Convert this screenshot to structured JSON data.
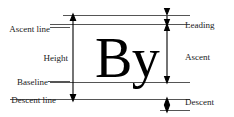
{
  "diagram": {
    "sample_text": "By",
    "colors": {
      "background": "#ffffff",
      "rule": "#555555",
      "arrow": "#000000",
      "text": "#1a1a1a",
      "glyph": "#000000"
    },
    "left_labels": [
      {
        "id": "ascent-line",
        "text": "Ascent line",
        "y": 29
      },
      {
        "id": "height",
        "text": "Height",
        "y": 58
      },
      {
        "id": "baseline",
        "text": "Baseline",
        "y": 82
      },
      {
        "id": "descent-line",
        "text": "Descent line",
        "y": 99
      }
    ],
    "right_labels": [
      {
        "id": "leading",
        "text": "Leading",
        "y": 25
      },
      {
        "id": "ascent",
        "text": "Ascent",
        "y": 57
      },
      {
        "id": "descent",
        "text": "Descent",
        "y": 103
      }
    ],
    "rules": [
      {
        "id": "leading-top-line",
        "y": 15,
        "x1": 63,
        "x2": 190
      },
      {
        "id": "ascent-line-rule",
        "y": 24.5,
        "x1": 50,
        "x2": 190
      },
      {
        "id": "baseline-rule",
        "y": 82,
        "x1": 50,
        "x2": 190
      },
      {
        "id": "descent-line-rule",
        "y": 99.5,
        "x1": 10,
        "x2": 190
      },
      {
        "id": "descent-bottom-rule",
        "y": 110,
        "x1": 160,
        "x2": 190
      }
    ],
    "measures": [
      {
        "id": "height-measure",
        "x": 73,
        "from": 15,
        "to": 99.5,
        "double": true
      },
      {
        "id": "leading-measure",
        "x": 167,
        "from": 15,
        "to": 24.5,
        "double": true
      },
      {
        "id": "ascent-measure",
        "x": 167,
        "from": 24.5,
        "to": 82,
        "double": true
      },
      {
        "id": "descent-measure",
        "x": 167,
        "from": 99.5,
        "to": 110,
        "double": true
      }
    ]
  }
}
